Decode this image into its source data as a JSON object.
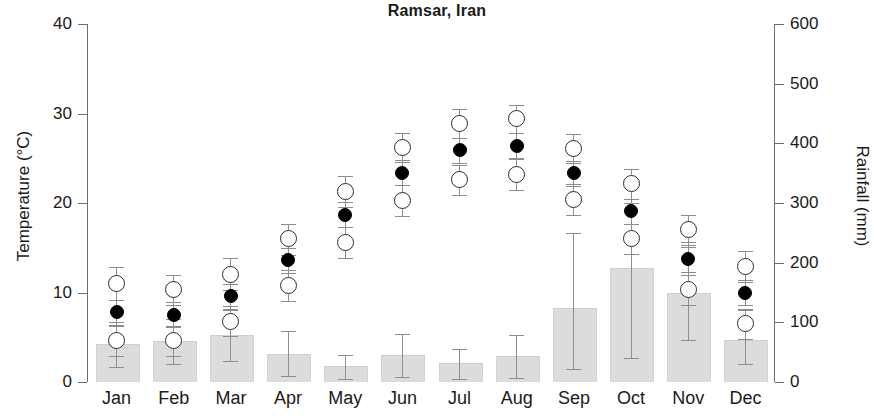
{
  "chart_data": {
    "type": "bar",
    "title": "Ramsar, Iran",
    "xlabel": "",
    "ylabel": "Temperature (°C)",
    "y2label": "Rainfall (mm)",
    "categories": [
      "Jan",
      "Feb",
      "Mar",
      "Apr",
      "May",
      "Jun",
      "Jul",
      "Aug",
      "Sep",
      "Oct",
      "Nov",
      "Dec"
    ],
    "ylim": [
      0,
      40
    ],
    "y2lim": [
      0,
      600
    ],
    "yticks": [
      0,
      10,
      20,
      30,
      40
    ],
    "y2ticks": [
      0,
      100,
      200,
      300,
      400,
      500,
      600
    ],
    "grid": false,
    "legend": "none",
    "series": [
      {
        "name": "Rainfall",
        "axis": "right",
        "units": "mm",
        "render": "bar",
        "values": [
          62,
          67,
          77,
          45,
          25,
          43,
          30,
          42,
          123,
          190,
          147,
          68
        ]
      },
      {
        "name": "Mean temperature",
        "axis": "left",
        "units": "°C",
        "render": "filled-circle",
        "values": [
          7.8,
          7.5,
          9.6,
          13.6,
          18.7,
          23.4,
          25.9,
          26.4,
          23.3,
          19.1,
          13.7,
          10.0
        ]
      },
      {
        "name": "Mean maximum temperature",
        "axis": "left",
        "units": "°C",
        "render": "open-circle",
        "values": [
          11.0,
          10.3,
          12.0,
          16.0,
          21.3,
          26.2,
          28.9,
          29.4,
          26.1,
          22.2,
          17.0,
          12.9
        ]
      },
      {
        "name": "Mean minimum temperature",
        "axis": "left",
        "units": "°C",
        "render": "open-circle",
        "values": [
          4.6,
          4.6,
          6.8,
          10.8,
          15.6,
          20.3,
          22.6,
          23.2,
          20.4,
          16.0,
          10.3,
          6.5
        ]
      }
    ],
    "error_bars": {
      "description": "Vertical whiskers with caps on each temperature marker",
      "max_temp": [
        {
          "low": 9.2,
          "high": 12.8
        },
        {
          "low": 8.6,
          "high": 12.0
        },
        {
          "low": 10.3,
          "high": 13.8
        },
        {
          "low": 14.2,
          "high": 17.7
        },
        {
          "low": 19.6,
          "high": 23.0
        },
        {
          "low": 24.6,
          "high": 27.8
        },
        {
          "low": 27.3,
          "high": 30.5
        },
        {
          "low": 27.8,
          "high": 31.0
        },
        {
          "low": 24.5,
          "high": 27.7
        },
        {
          "low": 20.5,
          "high": 23.8
        },
        {
          "low": 15.3,
          "high": 18.7
        },
        {
          "low": 11.2,
          "high": 14.6
        }
      ],
      "mean_temp": [
        {
          "low": 6.4,
          "high": 9.2
        },
        {
          "low": 6.1,
          "high": 8.9
        },
        {
          "low": 8.2,
          "high": 11.0
        },
        {
          "low": 12.2,
          "high": 15.0
        },
        {
          "low": 17.3,
          "high": 20.1
        },
        {
          "low": 22.0,
          "high": 24.8
        },
        {
          "low": 24.5,
          "high": 27.3
        },
        {
          "low": 25.0,
          "high": 27.8
        },
        {
          "low": 21.9,
          "high": 24.7
        },
        {
          "low": 17.7,
          "high": 20.5
        },
        {
          "low": 12.3,
          "high": 15.1
        },
        {
          "low": 8.6,
          "high": 11.4
        }
      ],
      "min_temp": [
        {
          "low": 2.9,
          "high": 6.3
        },
        {
          "low": 2.9,
          "high": 6.3
        },
        {
          "low": 5.1,
          "high": 8.5
        },
        {
          "low": 9.1,
          "high": 12.5
        },
        {
          "low": 13.9,
          "high": 17.3
        },
        {
          "low": 18.6,
          "high": 22.0
        },
        {
          "low": 20.9,
          "high": 24.3
        },
        {
          "low": 21.5,
          "high": 24.9
        },
        {
          "low": 18.7,
          "high": 22.1
        },
        {
          "low": 14.3,
          "high": 17.7
        },
        {
          "low": 8.6,
          "high": 12.0
        },
        {
          "low": 4.8,
          "high": 8.2
        }
      ],
      "rainfall": [
        {
          "low": 25,
          "high": 100
        },
        {
          "low": 30,
          "high": 105
        },
        {
          "low": 35,
          "high": 120
        },
        {
          "low": 10,
          "high": 85
        },
        {
          "low": 5,
          "high": 45
        },
        {
          "low": 8,
          "high": 80
        },
        {
          "low": 5,
          "high": 55
        },
        {
          "low": 6,
          "high": 78
        },
        {
          "low": 22,
          "high": 250
        },
        {
          "low": 40,
          "high": 300
        },
        {
          "low": 70,
          "high": 235
        },
        {
          "low": 30,
          "high": 120
        }
      ]
    }
  },
  "colors": {
    "bar_fill": "#dcdcdc",
    "marker_filled": "#000000",
    "marker_open": "#ffffff",
    "marker_edge": "#2b2b2b",
    "axis": "#6e6e6e",
    "text": "#1a1a1a"
  }
}
